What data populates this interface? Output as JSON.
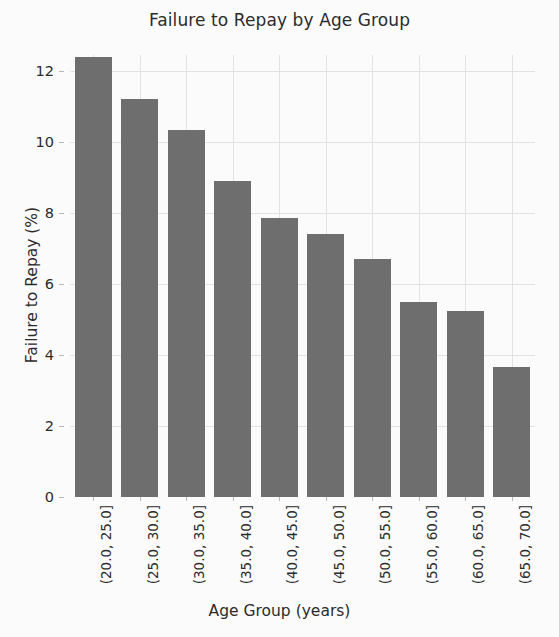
{
  "chart_data": {
    "type": "bar",
    "title": "Failure to Repay by Age Group",
    "xlabel": "Age Group (years)",
    "ylabel": "Failure to Repay (%)",
    "categories": [
      "(20.0, 25.0]",
      "(25.0, 30.0]",
      "(30.0, 35.0]",
      "(35.0, 40.0]",
      "(40.0, 45.0]",
      "(45.0, 50.0]",
      "(50.0, 55.0]",
      "(55.0, 60.0]",
      "(60.0, 65.0]",
      "(65.0, 70.0]"
    ],
    "values": [
      12.4,
      11.2,
      10.35,
      8.9,
      7.85,
      7.4,
      6.7,
      5.5,
      5.25,
      3.65
    ],
    "ylim": [
      0,
      12.45
    ],
    "ytick_labels": [
      "0",
      "2",
      "4",
      "6",
      "8",
      "10",
      "12"
    ],
    "ytick_values": [
      0,
      2,
      4,
      6,
      8,
      10,
      12
    ],
    "grid": true,
    "legend": null,
    "bar_color": "#6e6e6e",
    "grid_color": "#e2e2e2",
    "background_color": "#fbfbfb"
  }
}
